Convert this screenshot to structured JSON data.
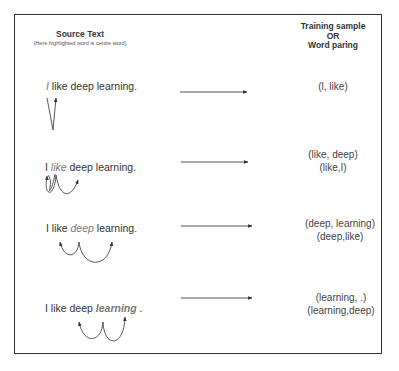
{
  "headers": {
    "source_title": "Source Text",
    "source_subtitle": "(Here highlighted word is centre word)",
    "target_line1": "Training sample",
    "target_line2": "OR",
    "target_line3": "Word paring"
  },
  "rows": [
    {
      "before": "",
      "centre": "I",
      "after": " like deep learning.",
      "pairs": [
        "(l, like)"
      ]
    },
    {
      "before": "I ",
      "centre": "like",
      "after": " deep learning.",
      "pairs": [
        "(like, deep)",
        "(like,I)"
      ]
    },
    {
      "before": "I like ",
      "centre": "deep",
      "after": " learning.",
      "pairs": [
        "(deep, learning)",
        "(deep,like)"
      ]
    },
    {
      "before": "I like deep ",
      "centre": "learning",
      "after": " .",
      "pairs": [
        "(learning, .)",
        "(learning,deep)"
      ]
    }
  ],
  "colors": {
    "line": "#333333",
    "highlight": "#777777",
    "text": "#333333"
  }
}
